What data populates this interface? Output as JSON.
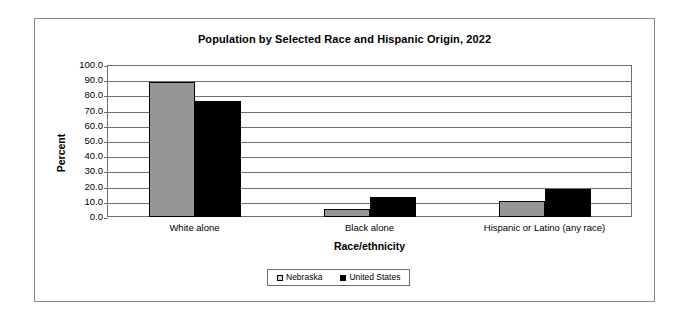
{
  "chart_data": {
    "type": "bar",
    "title": "Population by Selected Race and Hispanic Origin, 2022",
    "xlabel": "Race/ethnicity",
    "ylabel": "Percent",
    "categories": [
      "White alone",
      "Black alone",
      "Hispanic or Latino (any race)"
    ],
    "series": [
      {
        "name": "Nebraska",
        "color": "#969696",
        "values": [
          88.7,
          5.3,
          10.6
        ]
      },
      {
        "name": "United States",
        "color": "#000000",
        "values": [
          76.2,
          13.3,
          18.5
        ]
      }
    ],
    "ylim": [
      0,
      100
    ],
    "ytick_step": 10,
    "ytick_labels": [
      "100.0",
      "90.0",
      "80.0",
      "70.0",
      "60.0",
      "50.0",
      "40.0",
      "30.0",
      "20.0",
      "10.0",
      "0.0"
    ],
    "grid": true,
    "legend_position": "bottom-center"
  }
}
